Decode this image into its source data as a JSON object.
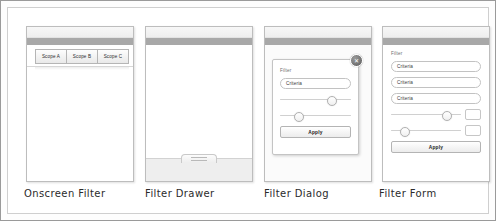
{
  "sheet": {
    "title": "Filter UI patterns sketch sheet"
  },
  "panels": [
    {
      "id": "onscreen-filter",
      "caption": "Onscreen Filter",
      "tabs": [
        {
          "label": "Scope A"
        },
        {
          "label": "Scope B"
        },
        {
          "label": "Scope C"
        }
      ]
    },
    {
      "id": "filter-drawer",
      "caption": "Filter Drawer",
      "handle": {
        "name": "drawer-handle",
        "grip_lines": 2
      }
    },
    {
      "id": "filter-dialog",
      "caption": "Filter Dialog",
      "dialog": {
        "label": "Filter",
        "close_icon": "close-icon",
        "close_glyph": "✕",
        "fields": [
          {
            "value": "Criteria"
          }
        ],
        "sliders": [
          {
            "position_pct": 72
          },
          {
            "position_pct": 25
          }
        ],
        "apply_label": "Apply"
      }
    },
    {
      "id": "filter-form",
      "caption": "Filter Form",
      "form": {
        "label": "Filter",
        "fields": [
          {
            "value": "Criteria"
          },
          {
            "value": "Criteria"
          },
          {
            "value": "Criteria"
          }
        ],
        "sliders": [
          {
            "position_pct": 78,
            "value": ""
          },
          {
            "position_pct": 18,
            "value": ""
          }
        ],
        "apply_label": "Apply"
      }
    }
  ],
  "colors": {
    "chrome_bar": "#a8a8a8",
    "chrome_top": "#f2f2f2",
    "panel_border": "#bdbdbd",
    "field_border": "#c2c2c2",
    "track": "#d0d0d0",
    "caption_text": "#2b2b2b"
  }
}
